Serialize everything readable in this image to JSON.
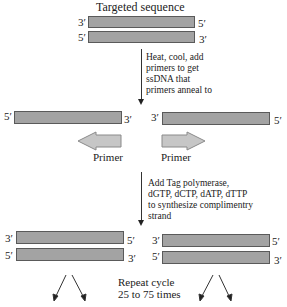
{
  "title": "Targeted sequence",
  "top_strands": [
    {
      "left_end": "3′",
      "right_end": "5′"
    },
    {
      "left_end": "5′",
      "right_end": "3′"
    }
  ],
  "step1": {
    "lines": [
      "Heat, cool, add",
      "primers to get",
      "ssDNA that",
      "primers anneal to"
    ]
  },
  "single_strands": {
    "left": {
      "left_end": "5′",
      "right_end": "3′"
    },
    "right": {
      "left_end": "3′",
      "right_end": "5′"
    }
  },
  "primers": {
    "left_label": "Primer",
    "right_label": "Primer",
    "left_direction": "left",
    "right_direction": "right"
  },
  "step2": {
    "lines": [
      "Add Tag polymerase,",
      "dGTP, dCTP, dATP, dTTP",
      "to synthesize complimentry",
      "strand"
    ]
  },
  "bottom_left_strands": [
    {
      "left_end": "3′",
      "right_end": "5′"
    },
    {
      "left_end": "5′",
      "right_end": "3′"
    }
  ],
  "bottom_right_strands": [
    {
      "left_end": "3′",
      "right_end": "5′"
    },
    {
      "left_end": "5′",
      "right_end": "3′"
    }
  ],
  "repeat": {
    "lines": [
      "Repeat cycle",
      "25 to 75 times"
    ]
  },
  "colors": {
    "strand_fill": "#a3a3a3",
    "strand_border": "#5a5a5a",
    "primer_fill": "#c6c6c6",
    "primer_border": "#8a8a8a",
    "arrow": "#222222"
  }
}
